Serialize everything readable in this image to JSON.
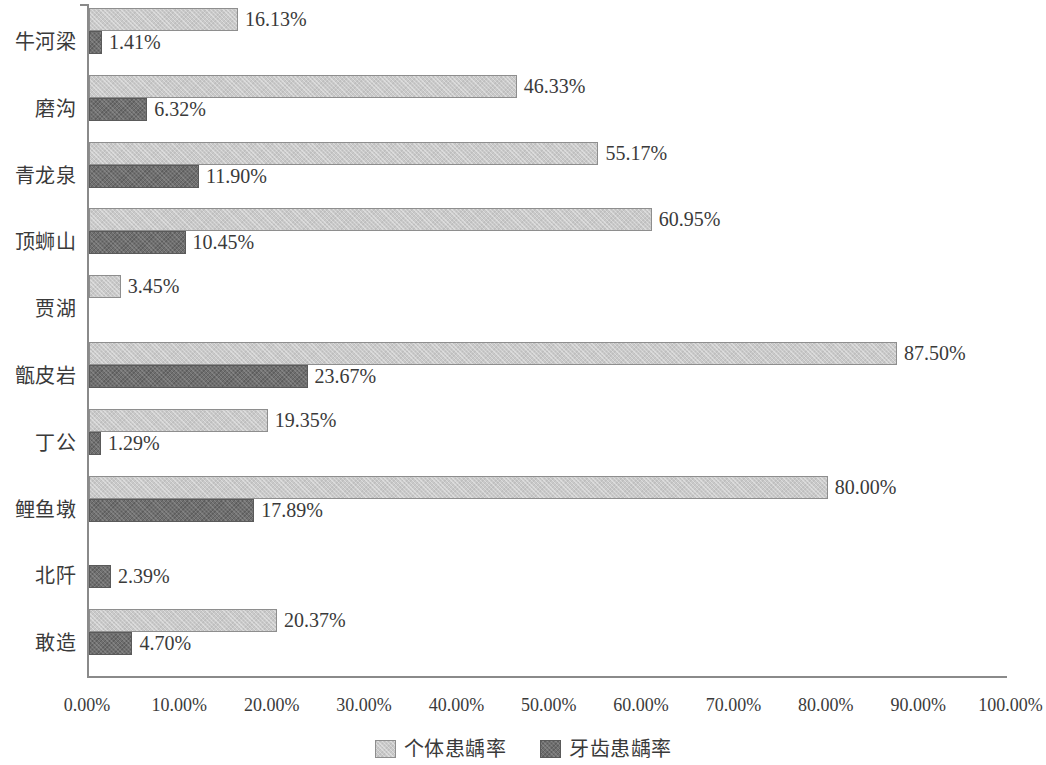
{
  "chart_data": {
    "type": "bar",
    "orientation": "horizontal",
    "title": "",
    "xlabel": "",
    "ylabel": "",
    "xlim": [
      0,
      100
    ],
    "grid": false,
    "legend_position": "bottom-center",
    "axis_unit": "%",
    "categories": [
      "牛河梁",
      "磨沟",
      "青龙泉",
      "顶蛳山",
      "贾湖",
      "甑皮岩",
      "丁公",
      "鲤鱼墩",
      "北阡",
      "敢造"
    ],
    "x_ticks": [
      "0.00%",
      "10.00%",
      "20.00%",
      "30.00%",
      "40.00%",
      "50.00%",
      "60.00%",
      "70.00%",
      "80.00%",
      "90.00%",
      "100.00%"
    ],
    "x_tick_values": [
      0,
      10,
      20,
      30,
      40,
      50,
      60,
      70,
      80,
      90,
      100
    ],
    "series": [
      {
        "name": "个体患龋率",
        "color": "#c9c9c9",
        "values": [
          16.13,
          46.33,
          55.17,
          60.95,
          3.45,
          87.5,
          19.35,
          80.0,
          null,
          20.37
        ],
        "labels": [
          "16.13%",
          "46.33%",
          "55.17%",
          "60.95%",
          "3.45%",
          "87.50%",
          "19.35%",
          "80.00%",
          null,
          "20.37%"
        ]
      },
      {
        "name": "牙齿患龋率",
        "color": "#6f6f6f",
        "values": [
          1.41,
          6.32,
          11.9,
          10.45,
          null,
          23.67,
          1.29,
          17.89,
          2.39,
          4.7
        ],
        "labels": [
          "1.41%",
          "6.32%",
          "11.90%",
          "10.45%",
          null,
          "23.67%",
          "1.29%",
          "17.89%",
          "2.39%",
          "4.70%"
        ]
      }
    ]
  },
  "legend": {
    "items": [
      {
        "label": "个体患龋率",
        "swatch": "light"
      },
      {
        "label": "牙齿患龋率",
        "swatch": "dark"
      }
    ]
  }
}
